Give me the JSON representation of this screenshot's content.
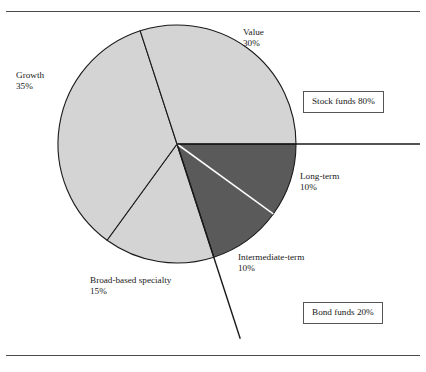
{
  "figure": {
    "background_color": "#ffffff",
    "rule_color": "#4a4a4a"
  },
  "chart_data": {
    "type": "pie",
    "title": "",
    "subtitle": "",
    "xlabel": "",
    "ylabel": "",
    "grid": false,
    "legend_position": "right",
    "units": "percent",
    "total": 100,
    "start_angle_deg": 0,
    "direction": "clockwise",
    "center": {
      "x": 177,
      "y": 144
    },
    "radius": 119,
    "colors": {
      "stock_slice": "#d4d4d4",
      "bond_slice": "#5a5a5a",
      "outline": "#1a1a1a",
      "bond_separator": "#ffffff"
    },
    "categories": [
      "Long-term",
      "Intermediate-term",
      "Broad-based specialty",
      "Growth",
      "Value"
    ],
    "values": [
      10,
      10,
      15,
      35,
      30
    ],
    "slices": [
      {
        "name": "Long-term",
        "label": "Long-term",
        "percent_text": "10%",
        "value": 10,
        "group": "Bond funds",
        "color": "#5a5a5a",
        "start_deg": 0,
        "end_deg": 36
      },
      {
        "name": "Intermediate-term",
        "label": "Intermediate-term",
        "percent_text": "10%",
        "value": 10,
        "group": "Bond funds",
        "color": "#5a5a5a",
        "start_deg": 36,
        "end_deg": 72
      },
      {
        "name": "Broad-based specialty",
        "label": "Broad-based specialty",
        "percent_text": "15%",
        "value": 15,
        "group": "Stock funds",
        "color": "#d4d4d4",
        "start_deg": 72,
        "end_deg": 126
      },
      {
        "name": "Growth",
        "label": "Growth",
        "percent_text": "35%",
        "value": 35,
        "group": "Stock funds",
        "color": "#d4d4d4",
        "start_deg": 126,
        "end_deg": 252
      },
      {
        "name": "Value",
        "label": "Value",
        "percent_text": "30%",
        "value": 30,
        "group": "Stock funds",
        "color": "#d4d4d4",
        "start_deg": 252,
        "end_deg": 360
      }
    ],
    "groups": [
      {
        "name": "Stock funds",
        "label": "Stock funds 80%",
        "value": 80
      },
      {
        "name": "Bond funds",
        "label": "Bond funds 20%",
        "value": 20
      }
    ],
    "annotations": [
      {
        "name": "stock-bond-divider-horizontal",
        "type": "line"
      },
      {
        "name": "stock-bond-divider-diagonal",
        "type": "line"
      }
    ]
  },
  "labels": {
    "value": {
      "name": "Value",
      "percent": "30%"
    },
    "growth": {
      "name": "Growth",
      "percent": "35%"
    },
    "long_term": {
      "name": "Long-term",
      "percent": "10%"
    },
    "inter_term": {
      "name": "Intermediate-term",
      "percent": "10%"
    },
    "broad": {
      "name": "Broad-based specialty",
      "percent": "15%"
    }
  },
  "legend": {
    "stock": "Stock funds 80%",
    "bond": "Bond funds 20%"
  }
}
